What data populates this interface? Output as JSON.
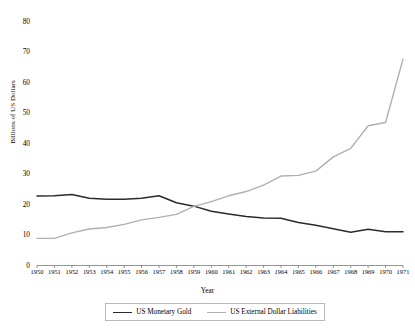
{
  "chart_data": {
    "type": "line",
    "title": "",
    "xlabel": "Year",
    "ylabel": "Billions of US Dollars",
    "x": [
      1950,
      1951,
      1952,
      1953,
      1954,
      1955,
      1956,
      1957,
      1958,
      1959,
      1960,
      1961,
      1962,
      1963,
      1964,
      1965,
      1966,
      1967,
      1968,
      1969,
      1970,
      1971
    ],
    "xticklabels": [
      "1950",
      "1951",
      "1952",
      "1953",
      "1954",
      "1955",
      "1956",
      "1957",
      "1958",
      "1959",
      "1960",
      "1961",
      "1962",
      "1963",
      "1964",
      "1965",
      "1966",
      "1967",
      "1968",
      "1969",
      "1970",
      "1971"
    ],
    "ylim": [
      0,
      80
    ],
    "yticks": [
      0,
      10,
      20,
      30,
      40,
      50,
      60,
      70,
      80
    ],
    "yticklabels": [
      "0",
      "10",
      "20",
      "30",
      "40",
      "50",
      "60",
      "70",
      "80"
    ],
    "grid": false,
    "legend_position": "bottom",
    "series": [
      {
        "name": "US Monetary Gold",
        "color": "#2b2b2b",
        "values": [
          22.8,
          22.9,
          23.3,
          22.1,
          21.8,
          21.8,
          22.1,
          22.9,
          20.6,
          19.5,
          17.8,
          16.9,
          16.1,
          15.6,
          15.5,
          14.1,
          13.2,
          12.1,
          10.9,
          11.9,
          11.1,
          11.1
        ]
      },
      {
        "name": "US External Dollar Liabilities",
        "color": "#b0b0b0",
        "values": [
          8.9,
          8.9,
          10.7,
          12.0,
          12.5,
          13.5,
          15.0,
          15.8,
          16.8,
          19.4,
          21.0,
          22.9,
          24.3,
          26.4,
          29.4,
          29.6,
          31.0,
          35.7,
          38.5,
          45.9,
          47.0,
          67.8
        ]
      }
    ]
  },
  "axes": {
    "ylabel": "Billions of US Dollars",
    "xlabel": "Year"
  },
  "legend": {
    "items": [
      {
        "label": "US Monetary Gold",
        "swatch": "gold"
      },
      {
        "label": "US External Dollar Liabilities",
        "swatch": "liab"
      }
    ]
  }
}
